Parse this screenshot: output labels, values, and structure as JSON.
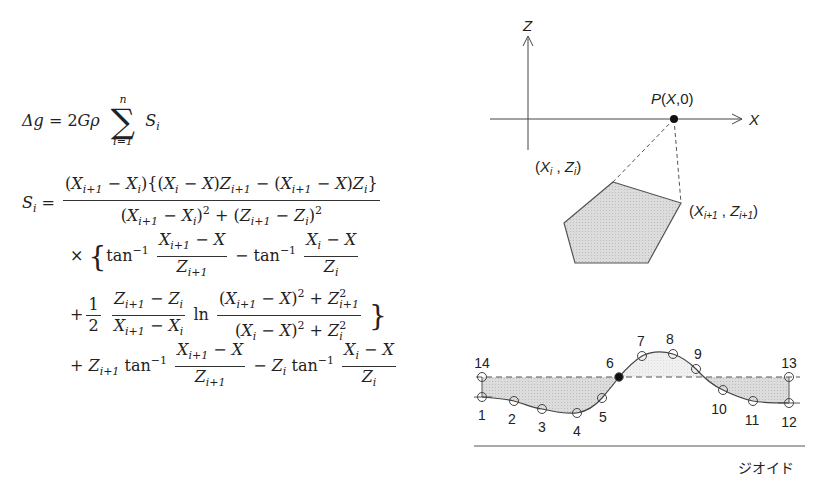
{
  "formula": {
    "line1": {
      "lhs": "Δg = 2Gρ",
      "sum_upper": "n",
      "sum_lower": "i=1",
      "sum_symbol": "∑",
      "term": "S",
      "term_sub": "i"
    },
    "line2": {
      "lhs": "S",
      "lhs_sub": "i",
      "eq": "=",
      "numerator": "(X_{i+1} − X_i){(X_i − X)Z_{i+1} − (X_{i+1} − X)Z_i}",
      "denominator": "(X_{i+1} − X_i)^2 + (Z_{i+1} − Z_i)^2"
    },
    "line3": {
      "prefix": "× {",
      "tan1": "tan⁻¹",
      "frac1_num": "X_{i+1} − X",
      "frac1_den": "Z_{i+1}",
      "minus": "−",
      "tan2": "tan⁻¹",
      "frac2_num": "X_i − X",
      "frac2_den": "Z_i"
    },
    "line4": {
      "prefix": "+",
      "half_num": "1",
      "half_den": "2",
      "frac_num": "Z_{i+1} − Z_i",
      "frac_den": "X_{i+1} − X_i",
      "ln": "ln",
      "ln_num": "(X_{i+1} − X)^2 + Z_{i+1}^2",
      "ln_den": "(X_i − X)^2 + Z_i^2",
      "suffix": "}"
    },
    "line5": {
      "prefix": "+ Z_{i+1} tan⁻¹",
      "frac1_num": "X_{i+1} − X",
      "frac1_den": "Z_{i+1}",
      "mid": "− Z_i tan⁻¹",
      "frac2_num": "X_i − X",
      "frac2_den": "Z_i"
    }
  },
  "polygon_diagram": {
    "z_axis_label": "Z",
    "x_axis_label": "X",
    "point_label": "P(X,0)",
    "vertex_i_label": "(X_i , Z_i)",
    "vertex_i1_label": "(X_{i+1} , Z_{i+1})",
    "fill_color": "#d9d9d9",
    "line_color": "#555555"
  },
  "profile_diagram": {
    "point_labels": [
      "1",
      "2",
      "3",
      "4",
      "5",
      "6",
      "7",
      "8",
      "9",
      "10",
      "11",
      "12",
      "13",
      "14"
    ],
    "geoid_label": "ジオイド",
    "shade_color": "#d4d4d4",
    "light_shade_color": "#ececec",
    "highlighted_point": "6"
  }
}
